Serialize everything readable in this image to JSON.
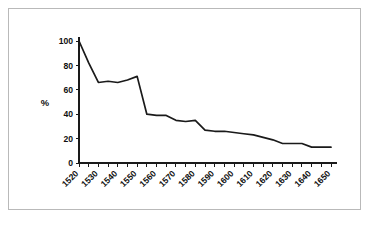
{
  "chart_data": {
    "type": "line",
    "title": "",
    "xlabel": "",
    "ylabel": "%",
    "xlim": [
      1520,
      1650
    ],
    "ylim": [
      0,
      100
    ],
    "grid": false,
    "legend": null,
    "y_ticks": [
      0,
      20,
      40,
      60,
      80,
      100
    ],
    "y_tick_labels": [
      "0",
      "20",
      "40",
      "60",
      "80",
      "100"
    ],
    "x_ticks": [
      1520,
      1530,
      1540,
      1550,
      1560,
      1570,
      1580,
      1590,
      1600,
      1610,
      1620,
      1630,
      1640,
      1650
    ],
    "x_tick_labels": [
      "1520",
      "1530",
      "1540",
      "1550",
      "1560",
      "1570",
      "1580",
      "1590",
      "1600",
      "1610",
      "1620",
      "1630",
      "1640",
      "1650"
    ],
    "x_minor_tick_step": 5,
    "x_tick_label_rotation": -45,
    "series": [
      {
        "name": "",
        "color": "#1a1a1a",
        "x": [
          1520,
          1525,
          1530,
          1535,
          1540,
          1545,
          1550,
          1555,
          1560,
          1565,
          1570,
          1575,
          1580,
          1585,
          1590,
          1595,
          1600,
          1605,
          1610,
          1615,
          1620,
          1625,
          1630,
          1635,
          1640,
          1645,
          1650
        ],
        "values": [
          100,
          82,
          66,
          67,
          66,
          68,
          71,
          40,
          39,
          39,
          35,
          34,
          35,
          27,
          26,
          26,
          25,
          24,
          23,
          21,
          19,
          16,
          16,
          16,
          13,
          13,
          13
        ]
      }
    ]
  },
  "figure": {
    "border_color": "#b9b9b9",
    "background_color": "#ffffff",
    "line_color": "#1a1a1a"
  }
}
